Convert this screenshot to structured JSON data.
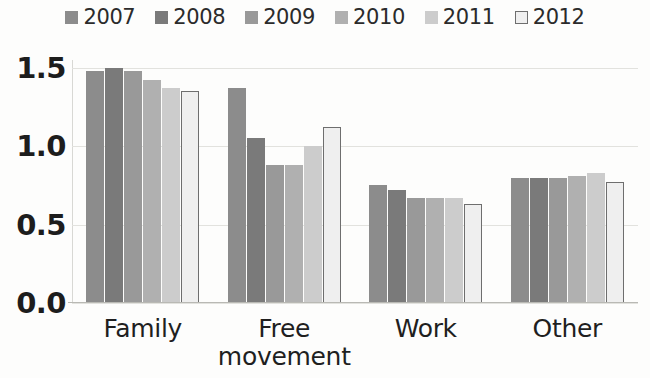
{
  "chart_data": {
    "type": "bar",
    "title": "",
    "subtitle": "",
    "xlabel": "",
    "ylabel": "",
    "categories": [
      "Family",
      "Free movement",
      "Work",
      "Other"
    ],
    "category_lines": [
      [
        "Family"
      ],
      [
        "Free",
        "movement"
      ],
      [
        "Work"
      ],
      [
        "Other"
      ]
    ],
    "series": [
      {
        "name": "2007",
        "color": "#8c8c8c",
        "border": "#8c8c8c",
        "values": [
          1.48,
          1.37,
          0.75,
          0.8
        ]
      },
      {
        "name": "2008",
        "color": "#7a7a7a",
        "border": "#7a7a7a",
        "values": [
          1.5,
          1.05,
          0.72,
          0.8
        ]
      },
      {
        "name": "2009",
        "color": "#999999",
        "border": "#999999",
        "values": [
          1.48,
          0.88,
          0.67,
          0.8
        ]
      },
      {
        "name": "2010",
        "color": "#b0b0b0",
        "border": "#b0b0b0",
        "values": [
          1.42,
          0.88,
          0.67,
          0.81
        ]
      },
      {
        "name": "2011",
        "color": "#cccccc",
        "border": "#cccccc",
        "values": [
          1.37,
          1.0,
          0.67,
          0.83
        ]
      },
      {
        "name": "2012",
        "color": "#efefef",
        "border": "#6e6e6e",
        "values": [
          1.35,
          1.12,
          0.63,
          0.77
        ]
      }
    ],
    "ylim": [
      0.0,
      1.55
    ],
    "yticks": [
      0.0,
      0.5,
      1.0,
      1.5
    ],
    "ytick_labels": [
      "0.0",
      "0.5",
      "1.0",
      "1.5"
    ],
    "grid": true,
    "grid_axis": "y",
    "legend_position": "top",
    "legend_orientation": "horizontal",
    "bar_gap_within_group": 1,
    "colors": {
      "grid": "#e2e2de",
      "axis": "#b9b9b4",
      "text": "#1d1d1d",
      "background": "#fdfdfc"
    }
  }
}
